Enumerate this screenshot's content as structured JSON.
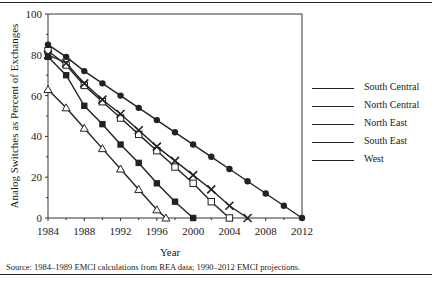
{
  "chart_data": {
    "type": "line",
    "title": "",
    "xlabel": "Year",
    "ylabel": "Analog Switches as Percent of Exchanges",
    "xlim": [
      1984,
      2012
    ],
    "ylim": [
      0,
      100
    ],
    "x_ticks": [
      "1984",
      "1988",
      "1992",
      "1996",
      "2000",
      "2004",
      "2008",
      "2012"
    ],
    "y_ticks": [
      "0",
      "20",
      "40",
      "60",
      "80",
      "100"
    ],
    "grid": false,
    "legend_position": "right",
    "series": [
      {
        "name": "South Central",
        "marker": "filled-circle",
        "x": [
          1984,
          1986,
          1988,
          1990,
          1992,
          1994,
          1996,
          1998,
          2000,
          2002,
          2004,
          2006,
          2008,
          2010,
          2012
        ],
        "values": [
          85,
          79,
          72,
          66,
          60,
          54,
          48,
          42,
          36,
          30,
          24,
          18,
          12,
          6,
          0
        ]
      },
      {
        "name": "North Central",
        "marker": "open-square",
        "x": [
          1984,
          1986,
          1988,
          1990,
          1992,
          1994,
          1996,
          1998,
          2000,
          2002,
          2004
        ],
        "values": [
          82,
          75,
          65,
          57,
          49,
          41,
          33,
          25,
          17,
          8,
          0
        ]
      },
      {
        "name": "North East",
        "marker": "x",
        "x": [
          1984,
          1986,
          1988,
          1990,
          1992,
          1994,
          1996,
          1998,
          2000,
          2002,
          2004,
          2006
        ],
        "values": [
          80,
          76,
          66,
          58,
          51,
          43,
          35,
          28,
          21,
          14,
          6,
          0
        ]
      },
      {
        "name": "South East",
        "marker": "filled-square",
        "x": [
          1984,
          1986,
          1988,
          1990,
          1992,
          1994,
          1996,
          1998,
          2000
        ],
        "values": [
          79,
          70,
          55,
          46,
          36,
          27,
          17,
          8,
          0
        ]
      },
      {
        "name": "West",
        "marker": "open-triangle",
        "x": [
          1984,
          1986,
          1988,
          1990,
          1992,
          1994,
          1996,
          1997
        ],
        "values": [
          63,
          54,
          44,
          34,
          24,
          14,
          4,
          0
        ]
      }
    ]
  },
  "legend": {
    "items": [
      {
        "label": "South Central"
      },
      {
        "label": "North Central"
      },
      {
        "label": "North East"
      },
      {
        "label": "South East"
      },
      {
        "label": "West"
      }
    ]
  },
  "source_note": "Source: 1984–1989 EMCI calculations from REA data; 1990–2012 EMCI projections."
}
